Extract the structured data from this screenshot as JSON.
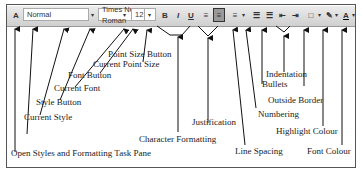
{
  "toolbar": {
    "styles_pane_icon": "styles-pane-icon",
    "current_style": "Normal",
    "current_font": "Times New Roman",
    "current_point_size": "12",
    "bold": "B",
    "italic": "I",
    "underline": "U",
    "line_spacing": "≡",
    "numbering": "☰",
    "bullets": "☰",
    "decrease_indent": "⇤",
    "increase_indent": "⇥",
    "border": "□",
    "highlight": "✎",
    "font_colour": "A",
    "dropdown": "▾"
  },
  "labels": {
    "point_size_button": "Point Size Button",
    "current_point_size": "Current Point Size",
    "font_button": "Font Button",
    "current_font": "Current Font",
    "style_button": "Style Button",
    "current_style": "Current Style",
    "open_styles": "Open Styles and Formatting Task Pane",
    "character_formatting": "Character Formatting",
    "justification": "Justification",
    "line_spacing": "Line Spacing",
    "numbering": "Numbering",
    "bullets": "Bullets",
    "indentation": "Indentation",
    "outside_border": "Outside Border",
    "highlight_colour": "Highlight Colour",
    "font_colour": "Font Colour"
  }
}
